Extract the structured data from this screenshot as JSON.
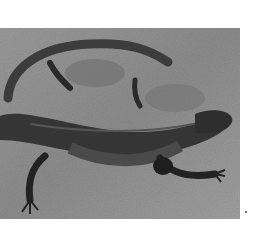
{
  "image": {
    "subject": "lizard on rock",
    "description": "Grayscale photograph of a lizard with a long tail curled over its back, resting on a textured rock surface",
    "colors": {
      "background": "#ffffff",
      "rock": "#8a8a8a",
      "rock_light": "#a8a8a8",
      "lizard_body": "#3a3a3a",
      "lizard_dark": "#1e1e1e"
    }
  }
}
